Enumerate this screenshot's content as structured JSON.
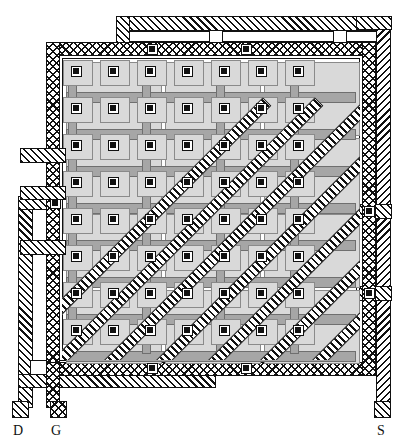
{
  "figure": {
    "kind": "ic-layout-mask-diagram",
    "width": 412,
    "height": 448
  },
  "colors": {
    "ink": "#111111",
    "background": "#ffffff",
    "diffusion_fill": "#d9d9d9",
    "diffusion_edge": "#8a8a8a",
    "poly_fill": "#a6a6a6",
    "poly_edge": "#6f6f6f",
    "contact_fill": "#111111"
  },
  "legend": {
    "items": [
      {
        "id": "drain",
        "label": "D",
        "hatch": "diagonal",
        "x": 12,
        "y": 401,
        "label_x": 13,
        "label_y": 424
      },
      {
        "id": "gate",
        "label": "G",
        "hatch": "cross",
        "x": 50,
        "y": 401,
        "label_x": 51,
        "label_y": 424
      },
      {
        "id": "source",
        "label": "S",
        "hatch": "diagonal",
        "x": 374,
        "y": 401,
        "label_x": 377,
        "label_y": 424
      }
    ]
  },
  "rails": {
    "drain_top": {
      "name": "drain-top-bus",
      "x": 116,
      "y": 16,
      "w": 274,
      "h": 15
    },
    "drain_left": {
      "name": "drain-left-bus",
      "x": 18,
      "y": 196,
      "w": 15,
      "h": 212
    },
    "drain_bottom": {
      "name": "drain-bottom-bus",
      "x": 18,
      "y": 374,
      "w": 198,
      "h": 14
    },
    "source_right": {
      "name": "source-right-bus",
      "x": 376,
      "y": 16,
      "w": 15,
      "h": 392
    },
    "source_tab": {
      "name": "source-tap-tab",
      "x": 356,
      "y": 204,
      "w": 36,
      "h": 15
    }
  },
  "gate_ring": {
    "name": "gate-ring",
    "outer": {
      "x": 46,
      "y": 42,
      "w": 330,
      "h": 334
    },
    "band": 14
  },
  "core": {
    "name": "device-core-array",
    "x": 62,
    "y": 58,
    "w": 298,
    "h": 302,
    "contact_columns": 7,
    "contact_rows": 8,
    "contact_size": 11,
    "col_pitch": 37,
    "row_pitch": 37,
    "first_col_x": 76,
    "first_row_y": 71,
    "diagonal_strip_count": 7,
    "diagonal_strip_width": 12,
    "diagonal_strip_pitch": 52,
    "diagonal_angle_deg": -45
  },
  "bus_bars": {
    "name": "poly-bus-bars",
    "rows_y": [
      92,
      129,
      166,
      203,
      240,
      277,
      314,
      351
    ],
    "x": 66,
    "w": 290,
    "h": 11
  }
}
